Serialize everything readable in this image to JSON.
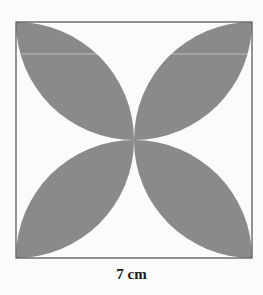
{
  "figure": {
    "type": "geometry-diagram",
    "shape": "square with four shaded petals (lens shapes) formed by quarter-circle arcs",
    "side_label": "7 cm",
    "colors": {
      "petal_fill": "#8a8a8a",
      "square_border": "#5a5a5a",
      "background": "#fbfbfb",
      "label": "#1a1a1a"
    },
    "square": {
      "x": 16,
      "y": 22,
      "size": 236
    },
    "petals": [
      "top-left",
      "top-right",
      "bottom-left",
      "bottom-right"
    ]
  }
}
